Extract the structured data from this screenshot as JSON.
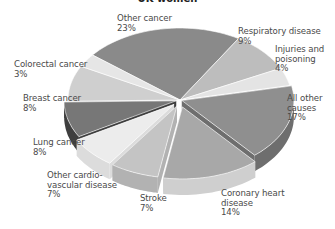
{
  "chart_data": {
    "type": "pie",
    "title": "UK women",
    "style": "3d-exploded-grayscale",
    "categories": [
      "Other cancer",
      "Respiratory disease",
      "Injuries and poisoning",
      "All other causes",
      "Coronary heart disease",
      "Stroke",
      "Other cardio-vascular disease",
      "Lung cancer",
      "Breast cancer",
      "Colorectal cancer"
    ],
    "values": [
      23,
      9,
      4,
      17,
      14,
      7,
      7,
      8,
      8,
      3
    ],
    "unit": "%",
    "colors": [
      "#8a8a8a",
      "#bdbdbd",
      "#e4e4e4",
      "#8f8f8f",
      "#a8a8a8",
      "#c4c4c4",
      "#ececec",
      "#777777",
      "#cfcfcf",
      "#e6e6e6"
    ],
    "side_colors": [
      "#6a6a6a",
      "#9a9a9a",
      "#c2c2c2",
      "#6e6e6e",
      "#cfcfcf",
      "#b2b2b2",
      "#dcdcdc",
      "#3e3e3e",
      "#a8a8a8",
      "#c8c8c8"
    ]
  },
  "labels": [
    {
      "line1": "Other cancer",
      "line2": "23%",
      "line3": ""
    },
    {
      "line1": "Respiratory disease",
      "line2": "9%",
      "line3": ""
    },
    {
      "line1": "Injuries and",
      "line2": "poisoning",
      "line3": "4%"
    },
    {
      "line1": "All other",
      "line2": "causes",
      "line3": "17%"
    },
    {
      "line1": "Coronary heart",
      "line2": "disease",
      "line3": "14%"
    },
    {
      "line1": "Stroke",
      "line2": "7%",
      "line3": ""
    },
    {
      "line1": "Other cardio-",
      "line2": "vascular disease",
      "line3": "7%"
    },
    {
      "line1": "Lung cancer",
      "line2": "8%",
      "line3": ""
    },
    {
      "line1": "Breast cancer",
      "line2": "8%",
      "line3": ""
    },
    {
      "line1": "Colorectal cancer",
      "line2": "3%",
      "line3": ""
    }
  ]
}
